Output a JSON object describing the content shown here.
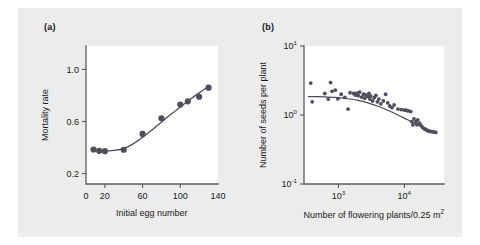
{
  "figure": {
    "background_color": "#ececec",
    "plot_background_color": "#ffffff",
    "marker_color": "#4e4e5e",
    "axis_color": "#5a5a66"
  },
  "panels": [
    {
      "label": "(a)",
      "xlabel": "Initial egg number",
      "ylabel": "Mortality rate"
    },
    {
      "label": "(b)",
      "xlabel_main": "Number of flowering plants/0.25 m",
      "xlabel_sup": "2",
      "ylabel": "Number of seeds per plant"
    }
  ],
  "chart_data": [
    {
      "type": "scatter",
      "panel": "(a)",
      "title": "",
      "xlabel": "Initial egg number",
      "ylabel": "Mortality rate",
      "xscale": "linear",
      "yscale": "linear",
      "xlim": [
        0,
        140
      ],
      "ylim": [
        0.12,
        1.18
      ],
      "xticks": [
        0,
        20,
        60,
        100,
        140
      ],
      "xticklabels": [
        "0",
        "20",
        "60",
        "100",
        "140"
      ],
      "yticks": [
        0.2,
        0.6,
        1.0
      ],
      "yticklabels": [
        "0.2",
        "0.6",
        "1.0"
      ],
      "grid": false,
      "legend": "none",
      "points": [
        {
          "x": 8,
          "y": 0.385
        },
        {
          "x": 14,
          "y": 0.375
        },
        {
          "x": 20,
          "y": 0.372
        },
        {
          "x": 40,
          "y": 0.383
        },
        {
          "x": 60,
          "y": 0.505
        },
        {
          "x": 80,
          "y": 0.625
        },
        {
          "x": 100,
          "y": 0.73
        },
        {
          "x": 108,
          "y": 0.755
        },
        {
          "x": 120,
          "y": 0.79
        },
        {
          "x": 130,
          "y": 0.86
        }
      ],
      "fit_curve": [
        {
          "x": 8,
          "y": 0.378
        },
        {
          "x": 20,
          "y": 0.372
        },
        {
          "x": 30,
          "y": 0.378
        },
        {
          "x": 40,
          "y": 0.392
        },
        {
          "x": 50,
          "y": 0.428
        },
        {
          "x": 60,
          "y": 0.478
        },
        {
          "x": 70,
          "y": 0.535
        },
        {
          "x": 80,
          "y": 0.595
        },
        {
          "x": 90,
          "y": 0.655
        },
        {
          "x": 100,
          "y": 0.712
        },
        {
          "x": 110,
          "y": 0.768
        },
        {
          "x": 120,
          "y": 0.82
        },
        {
          "x": 130,
          "y": 0.868
        }
      ]
    },
    {
      "type": "scatter",
      "panel": "(b)",
      "title": "",
      "xlabel": "Number of flowering plants/0.25 m2",
      "ylabel": "Number of seeds per plant",
      "xscale": "log",
      "yscale": "log",
      "xlim": [
        300,
        40000
      ],
      "ylim": [
        0.1,
        10
      ],
      "xticks": [
        1000,
        10000
      ],
      "xticklabels": [
        "10^3",
        "10^4"
      ],
      "yticks": [
        0.1,
        1,
        10
      ],
      "yticklabels": [
        "10^-1",
        "10^0",
        "10^1"
      ],
      "grid": false,
      "legend": "none",
      "points": [
        {
          "x": 380,
          "y": 2.9
        },
        {
          "x": 400,
          "y": 1.55
        },
        {
          "x": 620,
          "y": 2.05
        },
        {
          "x": 700,
          "y": 1.7
        },
        {
          "x": 760,
          "y": 2.95
        },
        {
          "x": 800,
          "y": 2.2
        },
        {
          "x": 900,
          "y": 2.3
        },
        {
          "x": 980,
          "y": 1.72
        },
        {
          "x": 1100,
          "y": 2.0
        },
        {
          "x": 1250,
          "y": 1.8
        },
        {
          "x": 1400,
          "y": 1.22
        },
        {
          "x": 1500,
          "y": 2.1
        },
        {
          "x": 1700,
          "y": 2.05
        },
        {
          "x": 1800,
          "y": 1.95
        },
        {
          "x": 1900,
          "y": 2.08
        },
        {
          "x": 2000,
          "y": 1.9
        },
        {
          "x": 2100,
          "y": 2.15
        },
        {
          "x": 2250,
          "y": 1.82
        },
        {
          "x": 2400,
          "y": 2.0
        },
        {
          "x": 2500,
          "y": 1.75
        },
        {
          "x": 2600,
          "y": 1.95
        },
        {
          "x": 2800,
          "y": 1.85
        },
        {
          "x": 2900,
          "y": 2.05
        },
        {
          "x": 3000,
          "y": 1.7
        },
        {
          "x": 3100,
          "y": 1.88
        },
        {
          "x": 3300,
          "y": 1.6
        },
        {
          "x": 3500,
          "y": 1.78
        },
        {
          "x": 3700,
          "y": 1.92
        },
        {
          "x": 3900,
          "y": 1.55
        },
        {
          "x": 4100,
          "y": 1.7
        },
        {
          "x": 4400,
          "y": 1.45
        },
        {
          "x": 4800,
          "y": 1.6
        },
        {
          "x": 5200,
          "y": 2.0
        },
        {
          "x": 5600,
          "y": 1.5
        },
        {
          "x": 6000,
          "y": 1.35
        },
        {
          "x": 6500,
          "y": 1.28
        },
        {
          "x": 7000,
          "y": 1.4
        },
        {
          "x": 8000,
          "y": 1.22
        },
        {
          "x": 9000,
          "y": 1.2
        },
        {
          "x": 10000,
          "y": 1.18
        },
        {
          "x": 10500,
          "y": 1.18
        },
        {
          "x": 11000,
          "y": 1.16
        },
        {
          "x": 11500,
          "y": 1.15
        },
        {
          "x": 12500,
          "y": 1.12
        },
        {
          "x": 13000,
          "y": 0.8
        },
        {
          "x": 13500,
          "y": 0.72
        },
        {
          "x": 14000,
          "y": 0.88
        },
        {
          "x": 15000,
          "y": 0.8
        },
        {
          "x": 15500,
          "y": 0.72
        },
        {
          "x": 16000,
          "y": 0.85
        },
        {
          "x": 17000,
          "y": 0.76
        },
        {
          "x": 18000,
          "y": 0.7
        },
        {
          "x": 19000,
          "y": 0.66
        },
        {
          "x": 20000,
          "y": 0.63
        },
        {
          "x": 21000,
          "y": 0.62
        },
        {
          "x": 22000,
          "y": 0.6
        },
        {
          "x": 23500,
          "y": 0.58
        },
        {
          "x": 25000,
          "y": 0.58
        },
        {
          "x": 26500,
          "y": 0.57
        },
        {
          "x": 28000,
          "y": 0.57
        },
        {
          "x": 30000,
          "y": 0.56
        }
      ],
      "fit_curve": [
        {
          "x": 350,
          "y": 1.85
        },
        {
          "x": 500,
          "y": 1.84
        },
        {
          "x": 700,
          "y": 1.82
        },
        {
          "x": 1000,
          "y": 1.78
        },
        {
          "x": 1400,
          "y": 1.72
        },
        {
          "x": 2000,
          "y": 1.63
        },
        {
          "x": 2800,
          "y": 1.5
        },
        {
          "x": 4000,
          "y": 1.34
        },
        {
          "x": 5600,
          "y": 1.17
        },
        {
          "x": 8000,
          "y": 1.0
        },
        {
          "x": 11000,
          "y": 0.86
        },
        {
          "x": 15000,
          "y": 0.74
        },
        {
          "x": 20000,
          "y": 0.65
        },
        {
          "x": 26000,
          "y": 0.59
        },
        {
          "x": 31000,
          "y": 0.56
        }
      ]
    }
  ]
}
